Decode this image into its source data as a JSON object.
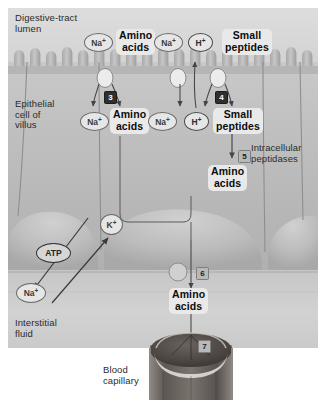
{
  "figure": {
    "background_color": "#ffffff"
  },
  "regions": {
    "lumen_label": "Digestive-tract\nlumen",
    "epithelial_label": "Epithelial\ncell of\nvillus",
    "interstitial_label": "Interstitial\nfluid",
    "capillary_label": "Blood\ncapillary",
    "peptidases_label": "Intracellular\npeptidases"
  },
  "lumen_solutes": [
    {
      "id": "na-lumen-1",
      "text": "Na",
      "charge": "+"
    },
    {
      "id": "amino-acids-lumen",
      "text": "Amino\nacids"
    },
    {
      "id": "na-lumen-2",
      "text": "Na",
      "charge": "+"
    },
    {
      "id": "h-lumen",
      "text": "H",
      "charge": "+"
    },
    {
      "id": "small-peptides-lumen",
      "text": "Small\npeptides"
    }
  ],
  "cytosol_solutes": [
    {
      "id": "na-cyto-1",
      "text": "Na",
      "charge": "+"
    },
    {
      "id": "amino-acids-cyto",
      "text": "Amino\nacids"
    },
    {
      "id": "na-cyto-2",
      "text": "Na",
      "charge": "+"
    },
    {
      "id": "h-cyto",
      "text": "H",
      "charge": "+"
    },
    {
      "id": "small-peptides-cyto",
      "text": "Small\npeptides"
    }
  ],
  "digest_product": {
    "id": "amino-acids-digested",
    "text": "Amino\nacids"
  },
  "basal_product": {
    "id": "amino-acids-basal",
    "text": "Amino\nacids"
  },
  "pump": {
    "atp_label": "ATP",
    "k_label": "K",
    "k_charge": "+",
    "na_label": "Na",
    "na_charge": "+"
  },
  "steps": [
    {
      "number": "3",
      "style": "dark",
      "meaning": "Na-coupled amino acid cotransport"
    },
    {
      "number": "4",
      "style": "dark",
      "meaning": "H-coupled small peptide cotransport"
    },
    {
      "number": "5",
      "style": "light",
      "meaning": "Intracellular peptidase digestion"
    },
    {
      "number": "6",
      "style": "light",
      "meaning": "Basolateral amino acid transport"
    },
    {
      "number": "7",
      "style": "light",
      "meaning": "Entry into blood capillary"
    }
  ],
  "colors": {
    "lumen_fill": "#d3d3d3",
    "cell_fill": "#b9b9b9",
    "cell_fill_light": "#c4c4c4",
    "interstitial_fill": "#cfcfcf",
    "capillary_dark": "#4e4a47",
    "capillary_mid": "#6d6763",
    "outline": "#6a6a6a",
    "arrow": "#4a4a4a",
    "step_dark_bg": "#2f2f2f",
    "step_light_bg": "#b9b9b9"
  }
}
